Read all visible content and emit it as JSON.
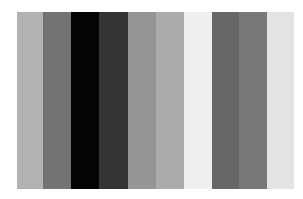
{
  "image": {
    "description": "Vertical grayscale bar pattern",
    "bars": [
      {
        "x": 0,
        "w": 26,
        "color": "#b3b3b3"
      },
      {
        "x": 26,
        "w": 28,
        "color": "#737373"
      },
      {
        "x": 54,
        "w": 28,
        "color": "#040404"
      },
      {
        "x": 82,
        "w": 29,
        "color": "#343434"
      },
      {
        "x": 111,
        "w": 28,
        "color": "#959595"
      },
      {
        "x": 139,
        "w": 28,
        "color": "#ababab"
      },
      {
        "x": 167,
        "w": 28,
        "color": "#efefef"
      },
      {
        "x": 195,
        "w": 27,
        "color": "#676767"
      },
      {
        "x": 222,
        "w": 28,
        "color": "#787878"
      },
      {
        "x": 250,
        "w": 27,
        "color": "#e3e3e3"
      }
    ]
  }
}
